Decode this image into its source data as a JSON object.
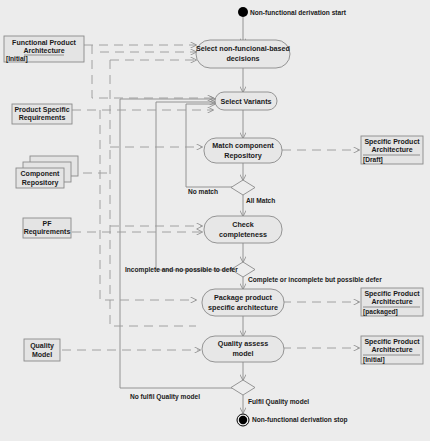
{
  "diagram": {
    "type": "UML activity diagram",
    "start_label": "Non-functional derivation start",
    "stop_label": "Non-functional derivation stop",
    "actions": [
      {
        "id": "a1",
        "line1": "Select non-funcional-based",
        "line2": "decisions"
      },
      {
        "id": "a2",
        "line1": "Select Variants",
        "line2": ""
      },
      {
        "id": "a3",
        "line1": "Match component",
        "line2": "Repository"
      },
      {
        "id": "a4",
        "line1": "Check",
        "line2": "completeness"
      },
      {
        "id": "a5",
        "line1": "Package product",
        "line2": "specific architecture"
      },
      {
        "id": "a6",
        "line1": "Quality assess",
        "line2": "model"
      }
    ],
    "inputs": [
      {
        "id": "i1",
        "line1": "Functional Product",
        "line2": "Architecture",
        "state": "[Initial]"
      },
      {
        "id": "i2",
        "line1": "Product Specific",
        "line2": "Requirements",
        "state": ""
      },
      {
        "id": "i3",
        "line1": "Component",
        "line2": "Repository",
        "state": ""
      },
      {
        "id": "i4",
        "line1": "PF",
        "line2": "Requirements",
        "state": ""
      },
      {
        "id": "i5",
        "line1": "Quality",
        "line2": "Model",
        "state": ""
      }
    ],
    "outputs": [
      {
        "id": "o1",
        "line1": "Specific Product",
        "line2": "Architecture",
        "state": "[Draft]"
      },
      {
        "id": "o2",
        "line1": "Specific Product",
        "line2": "Architecture",
        "state": "[packaged]"
      },
      {
        "id": "o3",
        "line1": "Specific Product",
        "line2": "Architecture",
        "state": "[Initial]"
      }
    ],
    "guards": {
      "no_match": "No match",
      "all_match": "All Match",
      "incomplete_no_defer": "Incomplete and no possible to defer",
      "complete_or_defer": "Complete or incomplete but possible defer",
      "no_fulfil": "No fulfil Quality model",
      "fulfil": "Fulfil Quality model"
    },
    "colors": {
      "background": "#ececec",
      "node_fill": "#e7e7e7",
      "stroke": "#8a8a8a",
      "terminal": "#000000",
      "text": "#1a1a1a"
    }
  }
}
